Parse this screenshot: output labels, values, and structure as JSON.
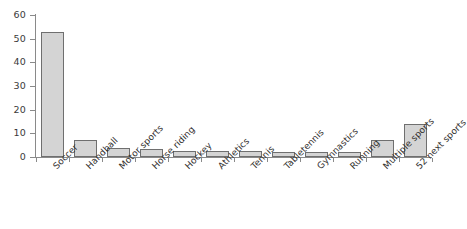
{
  "chart_data": {
    "type": "bar",
    "title": "",
    "subtitle": "",
    "xlabel": "",
    "ylabel": "",
    "categories": [
      "Soccer",
      "Handball",
      "Motor sports",
      "Horse riding",
      "Hockey",
      "Athletics",
      "Tennis",
      "Tabletennis",
      "Gymnastics",
      "Running",
      "Multiple sports",
      "52 next sports"
    ],
    "values": [
      53,
      7,
      4,
      3.3,
      2.7,
      2.7,
      2.7,
      2,
      2,
      2,
      7,
      14
    ],
    "ylim": [
      0,
      60
    ],
    "yticks": [
      0,
      10,
      20,
      30,
      40,
      50,
      60
    ],
    "ytick_labels": [
      "0",
      "10",
      "20",
      "30",
      "40",
      "50",
      "60"
    ],
    "grid": false,
    "legend": false,
    "legend_position": "none",
    "bar_fill_color": "#d4d4d4",
    "bar_edge_color": "#6f6f6f",
    "axis_color": "#8a8a8a",
    "background_color": "#ffffff",
    "xtick_label_rotation": -45
  }
}
